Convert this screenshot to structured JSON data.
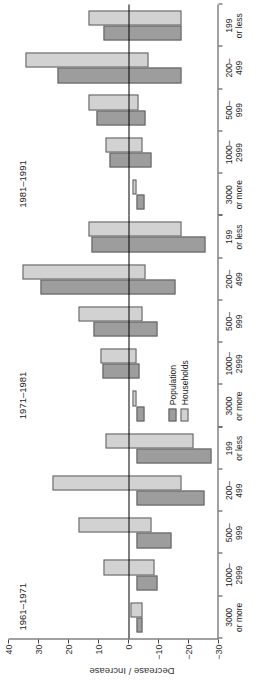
{
  "chart_data": {
    "type": "bar",
    "title": "",
    "xlabel": "",
    "ylabel": "Decrease / Increase",
    "ylim": [
      -30,
      40
    ],
    "yticks": [
      40,
      30,
      20,
      10,
      0,
      -10,
      -20,
      -30
    ],
    "grid": false,
    "orientation": "vertical-grouped",
    "legend_position": "inside-left-of-middle-panel",
    "legend": [
      "Population",
      "Households"
    ],
    "categories": [
      "3000\nor more",
      "1000–\n2999",
      "500–\n999",
      "200–\n499",
      "199\nor less"
    ],
    "category_lines": [
      [
        "3000",
        "or more"
      ],
      [
        "1000–",
        "2999"
      ],
      [
        "500–",
        "999"
      ],
      [
        "200–",
        "499"
      ],
      [
        "199",
        "or less"
      ]
    ],
    "panels": [
      {
        "label": "1961–1971",
        "series": [
          {
            "name": "Population",
            "values": [
              -2.0,
              -7.0,
              -11.5,
              -22.5,
              -25.0
            ]
          },
          {
            "name": "Households",
            "values": [
              2.0,
              11.0,
              19.5,
              28.0,
              10.5
            ]
          }
        ],
        "series_negative_extent": [
          {
            "name": "Population",
            "values": [
              0,
              0,
              0,
              0,
              0
            ]
          },
          {
            "name": "Households",
            "values": [
              -2.0,
              -6.0,
              -5.0,
              -15.0,
              -19.0
            ]
          }
        ]
      },
      {
        "label": "1971–1981",
        "series": [
          {
            "name": "Population",
            "values": [
              -2.5,
              11.5,
              14.5,
              32.0,
              15.0
            ]
          },
          {
            "name": "Households",
            "values": [
              1.5,
              12.0,
              19.5,
              38.0,
              16.0
            ]
          }
        ],
        "series_negative_extent": [
          {
            "name": "Population",
            "values": [
              0,
              -1.0,
              -7.0,
              -13.0,
              -23.0
            ]
          },
          {
            "name": "Households",
            "values": [
              0,
              0,
              -2.0,
              -3.0,
              -15.0
            ]
          }
        ]
      },
      {
        "label": "1981–1991",
        "series": [
          {
            "name": "Population",
            "values": [
              -2.5,
              9.0,
              13.5,
              26.5,
              11.0
            ]
          },
          {
            "name": "Households",
            "values": [
              1.5,
              10.5,
              16.0,
              37.0,
              16.0
            ]
          }
        ],
        "series_negative_extent": [
          {
            "name": "Population",
            "values": [
              0,
              -5.0,
              -3.0,
              -15.0,
              -15.0
            ]
          },
          {
            "name": "Households",
            "values": [
              0,
              -2.0,
              -0.5,
              -4.0,
              -15.0
            ]
          }
        ]
      }
    ],
    "colors": {
      "population": "#9d9d9d",
      "households": "#d2d2d2",
      "axis": "#444444",
      "zero_line": "#000000"
    }
  }
}
